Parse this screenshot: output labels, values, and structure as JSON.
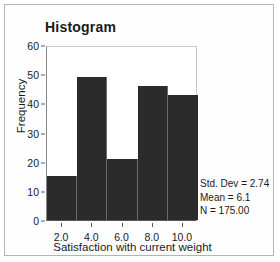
{
  "frame": {
    "border_color": "#b4b4b4",
    "background": "#ffffff"
  },
  "chart_data": {
    "type": "bar",
    "title": "Histogram",
    "xlabel": "Satisfaction with current weight",
    "ylabel": "Frequency",
    "bar_color": "#2b2b2b",
    "grid": false,
    "legend": "none",
    "xlim": [
      1,
      11
    ],
    "ylim": [
      0,
      60
    ],
    "bin_width": 2,
    "categories": [
      "1-3",
      "3-5",
      "5-7",
      "7-9",
      "9-11"
    ],
    "bin_edges": [
      1,
      3,
      5,
      7,
      9,
      11
    ],
    "bin_centers": [
      2,
      4,
      6,
      8,
      10
    ],
    "values": [
      15,
      49,
      21,
      46,
      43
    ],
    "xticklabels": [
      "2.0",
      "4.0",
      "6.0",
      "8.0",
      "10.0"
    ],
    "xtickvalues": [
      2,
      4,
      6,
      8,
      10
    ],
    "yticklabels": [
      "0",
      "10",
      "20",
      "30",
      "40",
      "50",
      "60"
    ],
    "ytickvalues": [
      0,
      10,
      20,
      30,
      40,
      50,
      60
    ],
    "annotations": [
      "Std. Dev = 2.74",
      "Mean = 6.1",
      "N = 175.00"
    ]
  },
  "stats": {
    "std_dev_line": "Std. Dev = 2.74",
    "mean_line": "Mean = 6.1",
    "n_line": "N = 175.00"
  }
}
